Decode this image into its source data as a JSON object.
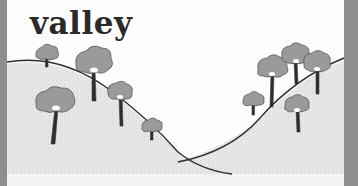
{
  "illustration": {
    "label": "valley",
    "colors": {
      "frame": "#8e8e8e",
      "background": "#fdfdfd",
      "ground": "#e4e4e4",
      "outline": "#2e2e2e",
      "tree_crown": "#9a9a9a",
      "trunk": "#2e2e2e"
    },
    "left_slope_trees": 5,
    "right_slope_trees": 5
  }
}
